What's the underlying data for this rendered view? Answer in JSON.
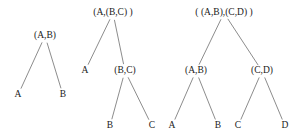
{
  "figure": {
    "title": "",
    "background_color": "#ffffff",
    "edge_color": "#6e6e6e",
    "text_color": "#1a1a1a",
    "width": 301,
    "height": 139
  },
  "trees": [
    {
      "name": "tree-pair-ab",
      "nodes": [
        {
          "id": "t1-root",
          "label": "(A,B)",
          "kind": "internal",
          "x": 45,
          "y": 36
        },
        {
          "id": "t1-a",
          "label": "A",
          "kind": "leaf",
          "x": 18,
          "y": 95
        },
        {
          "id": "t1-b",
          "label": "B",
          "kind": "leaf",
          "x": 63,
          "y": 95
        }
      ],
      "edges": [
        {
          "from": "t1-root",
          "to": "t1-a"
        },
        {
          "from": "t1-root",
          "to": "t1-b"
        }
      ]
    },
    {
      "name": "tree-pair-a-bc",
      "nodes": [
        {
          "id": "t2-root",
          "label": "(A,(B,C) )",
          "kind": "internal",
          "x": 113,
          "y": 13
        },
        {
          "id": "t2-a",
          "label": "A",
          "kind": "leaf",
          "x": 85,
          "y": 71
        },
        {
          "id": "t2-bc",
          "label": "(B,C)",
          "kind": "internal",
          "x": 125,
          "y": 71
        },
        {
          "id": "t2-b",
          "label": "B",
          "kind": "leaf",
          "x": 110,
          "y": 126
        },
        {
          "id": "t2-c",
          "label": "C",
          "kind": "leaf",
          "x": 152,
          "y": 126
        }
      ],
      "edges": [
        {
          "from": "t2-root",
          "to": "t2-a"
        },
        {
          "from": "t2-root",
          "to": "t2-bc"
        },
        {
          "from": "t2-bc",
          "to": "t2-b"
        },
        {
          "from": "t2-bc",
          "to": "t2-c"
        }
      ]
    },
    {
      "name": "tree-pair-ab-cd",
      "nodes": [
        {
          "id": "t3-root",
          "label": "( (A,B),(C,D) )",
          "kind": "internal",
          "x": 224,
          "y": 13
        },
        {
          "id": "t3-ab",
          "label": "(A,B)",
          "kind": "internal",
          "x": 196,
          "y": 71
        },
        {
          "id": "t3-cd",
          "label": "(C,D)",
          "kind": "internal",
          "x": 262,
          "y": 71
        },
        {
          "id": "t3-a",
          "label": "A",
          "kind": "leaf",
          "x": 172,
          "y": 126
        },
        {
          "id": "t3-b",
          "label": "B",
          "kind": "leaf",
          "x": 218,
          "y": 126
        },
        {
          "id": "t3-c",
          "label": "C",
          "kind": "leaf",
          "x": 238,
          "y": 126
        },
        {
          "id": "t3-d",
          "label": "D",
          "kind": "leaf",
          "x": 285,
          "y": 126
        }
      ],
      "edges": [
        {
          "from": "t3-root",
          "to": "t3-ab"
        },
        {
          "from": "t3-root",
          "to": "t3-cd"
        },
        {
          "from": "t3-ab",
          "to": "t3-a"
        },
        {
          "from": "t3-ab",
          "to": "t3-b"
        },
        {
          "from": "t3-cd",
          "to": "t3-c"
        },
        {
          "from": "t3-cd",
          "to": "t3-d"
        }
      ]
    }
  ]
}
